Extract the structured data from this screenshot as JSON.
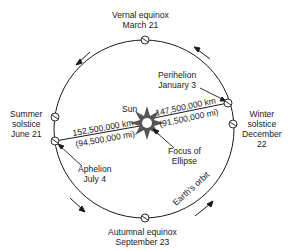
{
  "diagram": {
    "orbit_label": "Earth's orbit",
    "sun_label": "Sun",
    "focus_label": [
      "Focus of",
      "Ellipse"
    ],
    "positions": {
      "vernal": [
        "Vernal equinox",
        "March 21"
      ],
      "summer": [
        "Summer",
        "solstice",
        "June 21"
      ],
      "winter": [
        "Winter",
        "solstice",
        "December",
        "22"
      ],
      "autumnal": [
        "Autumnal equinox",
        "September 23"
      ],
      "perihelion": [
        "Perihelion",
        "January 3"
      ],
      "aphelion": [
        "Aphelion",
        "July 4"
      ]
    },
    "distances": {
      "perihelion_km": "147,500,000 km",
      "perihelion_mi": "(91,500,000 mi)",
      "aphelion_km": "152,500,000 km",
      "aphelion_mi": "(94,500,000 mi)"
    },
    "colors": {
      "line": "#1a1a1a",
      "sun": "#555555",
      "background": "#ffffff"
    }
  }
}
